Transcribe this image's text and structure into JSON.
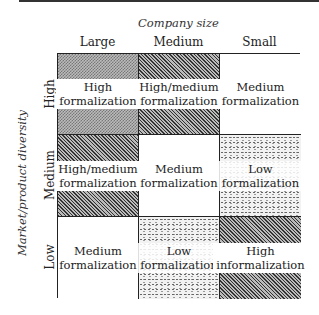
{
  "x_axis": {
    "title": "Company size",
    "columns": [
      "Large",
      "Medium",
      "Small"
    ]
  },
  "y_axis": {
    "title": "Market/product diversity",
    "rows": [
      "High",
      "Medium",
      "Low"
    ]
  },
  "cells": [
    {
      "row": "High",
      "col": "Large",
      "line1": "High",
      "line2": "formalization",
      "pattern": "checker"
    },
    {
      "row": "High",
      "col": "Medium",
      "line1": "High/medium",
      "line2": "formalization",
      "pattern": "hatch"
    },
    {
      "row": "High",
      "col": "Small",
      "line1": "Medium",
      "line2": "formalization",
      "pattern": "none"
    },
    {
      "row": "Medium",
      "col": "Large",
      "line1": "High/medium",
      "line2": "formalization",
      "pattern": "hatch"
    },
    {
      "row": "Medium",
      "col": "Medium",
      "line1": "Medium",
      "line2": "formalization",
      "pattern": "none"
    },
    {
      "row": "Medium",
      "col": "Small",
      "line1": "Low",
      "line2": "formalization",
      "pattern": "dots"
    },
    {
      "row": "Low",
      "col": "Large",
      "line1": "Medium",
      "line2": "formalization",
      "pattern": "none"
    },
    {
      "row": "Low",
      "col": "Medium",
      "line1": "Low",
      "line2": "formalization",
      "pattern": "dots"
    },
    {
      "row": "Low",
      "col": "Small",
      "line1": "High",
      "line2": "informalization",
      "pattern": "hatch"
    }
  ]
}
